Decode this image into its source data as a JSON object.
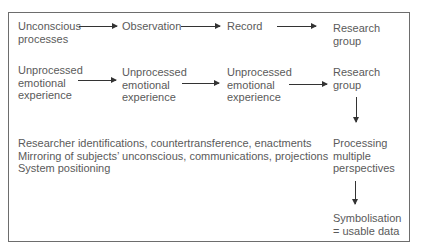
{
  "diagram": {
    "row1": {
      "n1": "Unconscious",
      "n1b": "processes",
      "n2": "Observation",
      "n3": "Record",
      "n4": "Research",
      "n4b": "group"
    },
    "row2": {
      "n1": "Unprocessed",
      "n1b": "emotional",
      "n1c": "experience",
      "n2": "Unprocessed",
      "n2b": "emotional",
      "n2c": "experience",
      "n3": "Unprocessed",
      "n3b": "emotional",
      "n3c": "experience",
      "n4": "Research",
      "n4b": "group"
    },
    "notes": [
      "Researcher identifications, countertransference, enactments",
      "Mirroring of subjects’ unconscious, communications, projections",
      "System positioning"
    ],
    "processing": [
      "Processing",
      "multiple",
      "perspectives"
    ],
    "symbolisation": [
      "Symbolisation",
      "= usable data"
    ]
  }
}
